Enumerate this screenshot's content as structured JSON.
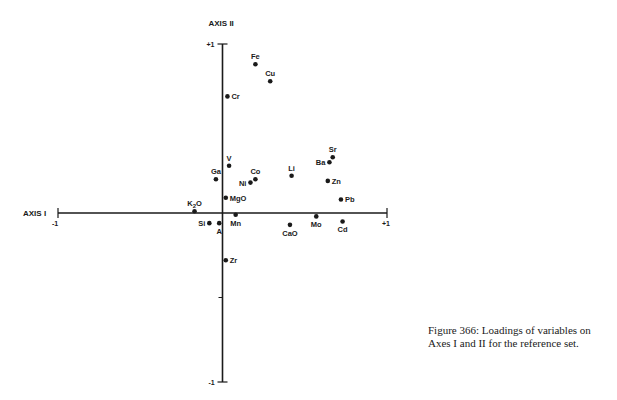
{
  "chart_data": {
    "type": "scatter",
    "title": "",
    "xlabel": "AXIS I",
    "ylabel": "AXIS II",
    "xlim": [
      -1,
      1
    ],
    "ylim": [
      -1,
      1
    ],
    "x_ticks": [
      "-1",
      "+1"
    ],
    "y_ticks": [
      "+1",
      "-1"
    ],
    "grid": false,
    "points": [
      {
        "label": "Fe",
        "x": 0.2,
        "y": 0.88,
        "pos": "above"
      },
      {
        "label": "Cu",
        "x": 0.29,
        "y": 0.78,
        "pos": "above"
      },
      {
        "label": "Cr",
        "x": 0.03,
        "y": 0.69,
        "pos": "right"
      },
      {
        "label": "V",
        "x": 0.04,
        "y": 0.28,
        "pos": "above"
      },
      {
        "label": "Ga",
        "x": -0.04,
        "y": 0.2,
        "pos": "above"
      },
      {
        "label": "Co",
        "x": 0.2,
        "y": 0.2,
        "pos": "above"
      },
      {
        "label": "Ni",
        "x": 0.17,
        "y": 0.18,
        "pos": "left"
      },
      {
        "label": "Li",
        "x": 0.42,
        "y": 0.22,
        "pos": "above"
      },
      {
        "label": "Sr",
        "x": 0.67,
        "y": 0.33,
        "pos": "above"
      },
      {
        "label": "Ba",
        "x": 0.65,
        "y": 0.3,
        "pos": "left"
      },
      {
        "label": "Zn",
        "x": 0.64,
        "y": 0.19,
        "pos": "right"
      },
      {
        "label": "Pb",
        "x": 0.72,
        "y": 0.08,
        "pos": "right"
      },
      {
        "label": "MgO",
        "x": 0.02,
        "y": 0.09,
        "pos": "right"
      },
      {
        "label": "K2O",
        "x": -0.17,
        "y": 0.01,
        "pos": "above"
      },
      {
        "label": "Mn",
        "x": 0.08,
        "y": -0.01,
        "pos": "below"
      },
      {
        "label": "Si",
        "x": -0.08,
        "y": -0.06,
        "pos": "left"
      },
      {
        "label": "A",
        "x": -0.02,
        "y": -0.06,
        "pos": "below"
      },
      {
        "label": "CaO",
        "x": 0.41,
        "y": -0.07,
        "pos": "below"
      },
      {
        "label": "Mo",
        "x": 0.57,
        "y": -0.02,
        "pos": "below"
      },
      {
        "label": "Cd",
        "x": 0.73,
        "y": -0.05,
        "pos": "below"
      },
      {
        "label": "Zr",
        "x": 0.02,
        "y": -0.28,
        "pos": "right"
      }
    ]
  },
  "caption": "Figure 366: Loadings of variables on Axes I and II for the reference set."
}
